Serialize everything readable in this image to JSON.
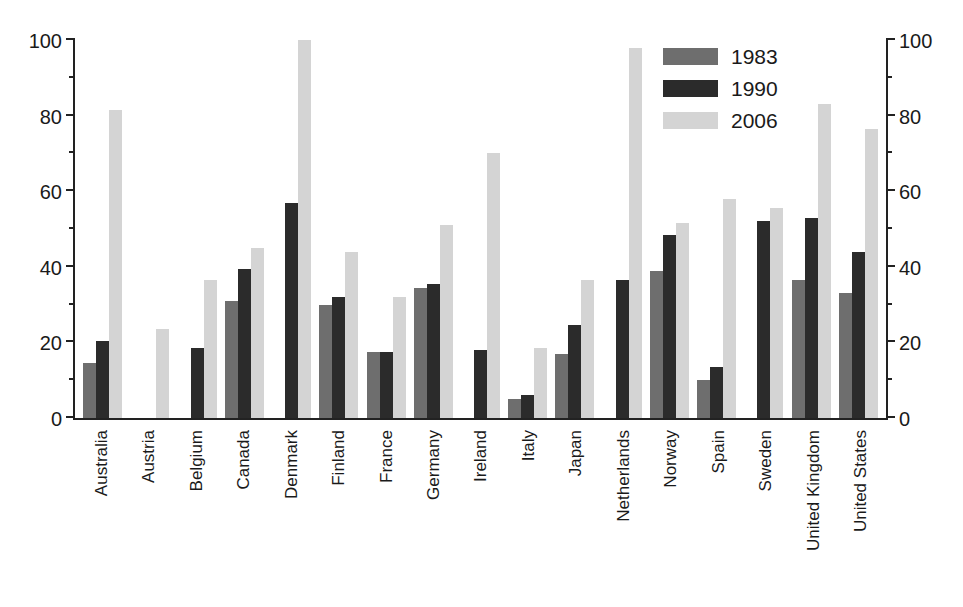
{
  "chart_data": {
    "type": "bar",
    "title": "",
    "subtitle": "",
    "xlabel": "",
    "ylabel": "",
    "ylim": [
      0,
      100
    ],
    "yticks": [
      0,
      20,
      40,
      60,
      80,
      100
    ],
    "yticks_minor": [
      10,
      30,
      50,
      70,
      90
    ],
    "grid": false,
    "legend_position": "top-right",
    "dual_y_axis": true,
    "categories": [
      "Australia",
      "Austria",
      "Belgium",
      "Canada",
      "Denmark",
      "Finland",
      "France",
      "Germany",
      "Ireland",
      "Italy",
      "Japan",
      "Netherlands",
      "Norway",
      "Spain",
      "Sweden",
      "United Kingdom",
      "United States"
    ],
    "series": [
      {
        "name": "1983",
        "color": "#6e6e6e",
        "values": [
          14.5,
          null,
          null,
          31,
          null,
          30,
          17.5,
          34.5,
          null,
          5,
          17,
          null,
          39,
          10,
          null,
          36.5,
          33
        ]
      },
      {
        "name": "1990",
        "color": "#2b2b2b",
        "values": [
          20.5,
          null,
          18.5,
          39.5,
          57,
          32,
          17.5,
          35.5,
          18,
          6,
          24.5,
          36.5,
          48.5,
          13.5,
          52,
          53,
          44
        ]
      },
      {
        "name": "2006",
        "color": "#d4d4d4",
        "values": [
          81.5,
          23.5,
          36.5,
          45,
          100,
          44,
          32,
          51,
          70,
          18.5,
          36.5,
          98,
          51.5,
          58,
          55.5,
          83,
          76.5
        ]
      }
    ]
  },
  "axis": {
    "left_labels": [
      "100",
      "80",
      "60",
      "40",
      "20",
      "0"
    ],
    "right_labels": [
      "100",
      "80",
      "60",
      "40",
      "20",
      "0"
    ]
  },
  "legend": {
    "items": [
      {
        "label": "1983",
        "key": "s1983"
      },
      {
        "label": "1990",
        "key": "s1990"
      },
      {
        "label": "2006",
        "key": "s2006"
      }
    ]
  }
}
